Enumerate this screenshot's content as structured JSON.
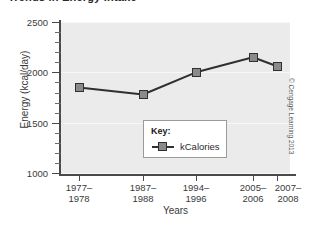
{
  "figure": {
    "title_partial": "Trends in Energy Intake",
    "credit": "© Cengage Learning 2013"
  },
  "legend": {
    "title": "Key:",
    "entries": [
      {
        "label": "kCalories"
      }
    ]
  },
  "chart_data": {
    "type": "line",
    "title": "Trends in Energy Intake",
    "xlabel": "Years",
    "ylabel": "Energy (kcal/day)",
    "categories": [
      "1977–\n1978",
      "1987–\n1988",
      "1994–\n1996",
      "2005–\n2006",
      "2007–\n2008"
    ],
    "category_lines": [
      [
        "1977–",
        "1978"
      ],
      [
        "1987–",
        "1988"
      ],
      [
        "1994–",
        "1996"
      ],
      [
        "2005–",
        "2006"
      ],
      [
        "2007–",
        "2008"
      ]
    ],
    "series": [
      {
        "name": "kCalories",
        "values": [
          1850,
          1780,
          2000,
          2150,
          2060
        ]
      }
    ],
    "ylim": [
      1000,
      2500
    ],
    "ytick_labels": [
      "1000",
      "1500",
      "2000",
      "2500"
    ],
    "ytick_values": [
      1000,
      1500,
      2000,
      2500
    ],
    "yminor_step": 100,
    "grid": true,
    "legend_position": "inside-center",
    "marker": "square",
    "colors": {
      "marker_fill": "#8a8a8a",
      "line": "#303030",
      "plot_background": "#ebebeb",
      "axis": "#4a4a4a"
    }
  }
}
